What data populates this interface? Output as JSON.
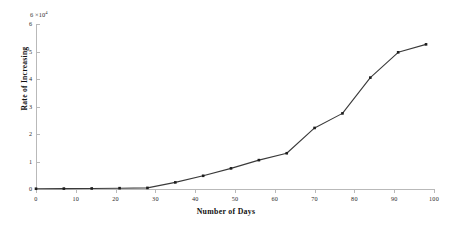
{
  "figure": {
    "background_color": "#ffffff",
    "line_color": "#3a3a3a",
    "marker_color": "#1d1d1d",
    "axis_color": "#b9b9b9"
  },
  "axes": {
    "y_exponent_prefix": "6",
    "y_exponent_mult": " ×10",
    "y_exponent_power": "4",
    "y_label": "Rate of Increasing",
    "x_label": "Number of Days",
    "x_ticks": [
      0,
      10,
      20,
      30,
      40,
      50,
      60,
      70,
      80,
      90,
      100
    ],
    "y_ticks": [
      0,
      1,
      2,
      3,
      4,
      5,
      6
    ],
    "x_tick_labels": [
      "0",
      "10",
      "20",
      "30",
      "40",
      "50",
      "60",
      "70",
      "80",
      "90",
      "100"
    ],
    "y_tick_labels": [
      "0",
      "1",
      "2",
      "3",
      "4",
      "5",
      "6"
    ]
  },
  "chart_data": {
    "type": "line",
    "title": "",
    "xlabel": "Number of Days",
    "ylabel": "Rate of Increasing",
    "y_scale_exponent": 4,
    "y_unit_note": "values in units of 1e4",
    "xlim": [
      0,
      100
    ],
    "ylim": [
      0,
      6
    ],
    "grid": false,
    "legend": null,
    "marker": "square",
    "series": [
      {
        "name": "Rate of Increasing",
        "x": [
          0,
          7,
          14,
          21,
          28,
          35,
          42,
          49,
          56,
          63,
          70,
          77,
          84,
          91,
          98
        ],
        "y": [
          0.01,
          0.015,
          0.02,
          0.03,
          0.04,
          0.24,
          0.48,
          0.75,
          1.05,
          1.3,
          2.22,
          2.75,
          4.05,
          4.97,
          5.26
        ]
      }
    ]
  }
}
